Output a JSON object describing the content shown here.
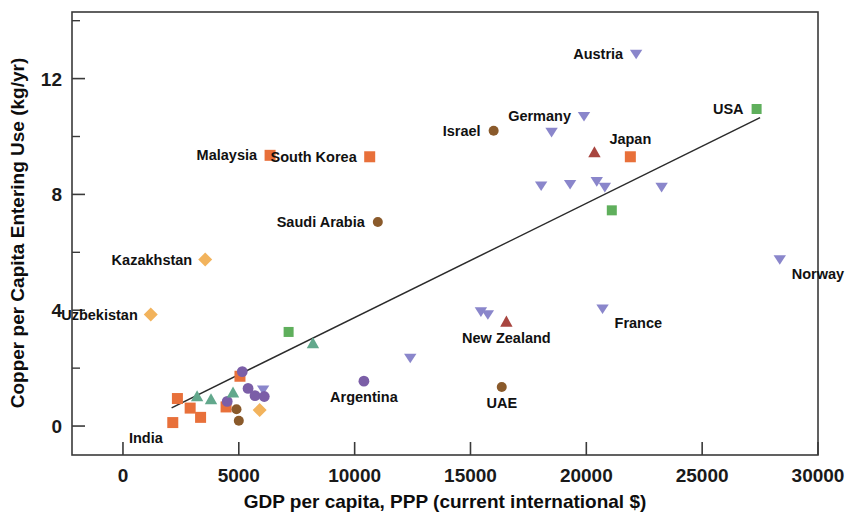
{
  "chart_data": {
    "type": "scatter",
    "title": "",
    "xlabel": "GDP per capita, PPP (current international $)",
    "ylabel": "Copper per Capita Entering Use (kg/yr)",
    "xlim": [
      -2200,
      30000
    ],
    "ylim": [
      -1.0,
      14.3
    ],
    "xticks": [
      0,
      5000,
      10000,
      15000,
      20000,
      25000,
      30000
    ],
    "xtick_labels": [
      "0",
      "5000",
      "10000",
      "15000",
      "20000",
      "25000",
      "30000"
    ],
    "yticks": [
      0,
      4,
      8,
      12
    ],
    "ytick_labels": [
      "0",
      "4",
      "8",
      "12"
    ],
    "yminor_ticks": [
      2,
      6,
      10,
      14
    ],
    "grid": false,
    "legend": "none",
    "marker_colors": {
      "orange_square": "#E8703A",
      "green_square": "#5FAF5C",
      "green_triangle": "#62A88C",
      "purple_circle": "#7B5EA7",
      "purple_triangle_down": "#8A86CB",
      "red_triangle_up": "#A8453F",
      "brown_circle": "#8A5A2B",
      "gold_diamond": "#F2B35C"
    },
    "trendline": {
      "x_start": 2100,
      "y_start": 0.63,
      "x_end": 27500,
      "y_end": 10.65
    },
    "points": [
      {
        "label": "India",
        "label_pos": "below-left",
        "x": 2150,
        "y": 0.12,
        "marker": "orange_square"
      },
      {
        "label": "",
        "x": 2350,
        "y": 0.95,
        "marker": "orange_square"
      },
      {
        "label": "",
        "x": 2900,
        "y": 0.62,
        "marker": "orange_square"
      },
      {
        "label": "",
        "x": 3350,
        "y": 0.3,
        "marker": "orange_square"
      },
      {
        "label": "",
        "x": 3200,
        "y": 1.02,
        "marker": "green_triangle"
      },
      {
        "label": "",
        "x": 3800,
        "y": 0.92,
        "marker": "green_triangle"
      },
      {
        "label": "",
        "x": 4450,
        "y": 0.66,
        "marker": "orange_square"
      },
      {
        "label": "",
        "x": 4500,
        "y": 0.85,
        "marker": "purple_circle"
      },
      {
        "label": "",
        "x": 4750,
        "y": 1.15,
        "marker": "green_triangle"
      },
      {
        "label": "",
        "x": 4900,
        "y": 0.58,
        "marker": "brown_circle"
      },
      {
        "label": "",
        "x": 5000,
        "y": 0.18,
        "marker": "brown_circle"
      },
      {
        "label": "",
        "x": 5050,
        "y": 1.72,
        "marker": "orange_square"
      },
      {
        "label": "",
        "x": 5150,
        "y": 1.88,
        "marker": "purple_circle"
      },
      {
        "label": "",
        "x": 5400,
        "y": 1.3,
        "marker": "purple_circle"
      },
      {
        "label": "",
        "x": 5700,
        "y": 1.05,
        "marker": "purple_circle"
      },
      {
        "label": "",
        "x": 6050,
        "y": 1.25,
        "marker": "purple_triangle_down"
      },
      {
        "label": "",
        "x": 6100,
        "y": 1.02,
        "marker": "purple_circle"
      },
      {
        "label": "",
        "x": 5900,
        "y": 0.55,
        "marker": "gold_diamond"
      },
      {
        "label": "Kazakhstan",
        "label_pos": "left",
        "x": 3550,
        "y": 5.75,
        "marker": "gold_diamond"
      },
      {
        "label": "Uzbekistan",
        "label_pos": "left",
        "x": 1200,
        "y": 3.85,
        "marker": "gold_diamond"
      },
      {
        "label": "Malaysia",
        "label_pos": "left",
        "x": 6350,
        "y": 9.35,
        "marker": "orange_square"
      },
      {
        "label": "",
        "x": 7150,
        "y": 3.25,
        "marker": "green_square"
      },
      {
        "label": "",
        "x": 8200,
        "y": 2.85,
        "marker": "green_triangle"
      },
      {
        "label": "Argentina",
        "label_pos": "below",
        "x": 10400,
        "y": 1.55,
        "marker": "purple_circle"
      },
      {
        "label": "South Korea",
        "label_pos": "left",
        "x": 10650,
        "y": 9.3,
        "marker": "orange_square"
      },
      {
        "label": "Saudi Arabia",
        "label_pos": "left",
        "x": 11000,
        "y": 7.05,
        "marker": "brown_circle"
      },
      {
        "label": "",
        "x": 12400,
        "y": 2.35,
        "marker": "purple_triangle_down"
      },
      {
        "label": "Israel",
        "label_pos": "left",
        "x": 16000,
        "y": 10.2,
        "marker": "brown_circle"
      },
      {
        "label": "",
        "x": 15450,
        "y": 3.95,
        "marker": "purple_triangle_down"
      },
      {
        "label": "",
        "x": 15750,
        "y": 3.85,
        "marker": "purple_triangle_down"
      },
      {
        "label": "New Zealand",
        "label_pos": "below",
        "x": 16550,
        "y": 3.6,
        "marker": "red_triangle_up"
      },
      {
        "label": "UAE",
        "label_pos": "below",
        "x": 16350,
        "y": 1.35,
        "marker": "brown_circle"
      },
      {
        "label": "",
        "x": 18050,
        "y": 8.3,
        "marker": "purple_triangle_down"
      },
      {
        "label": "",
        "x": 18500,
        "y": 10.15,
        "marker": "purple_triangle_down"
      },
      {
        "label": "",
        "x": 19300,
        "y": 8.35,
        "marker": "purple_triangle_down"
      },
      {
        "label": "Germany",
        "label_pos": "left",
        "x": 19900,
        "y": 10.7,
        "marker": "purple_triangle_down"
      },
      {
        "label": "",
        "x": 20350,
        "y": 9.45,
        "marker": "red_triangle_up"
      },
      {
        "label": "",
        "x": 20450,
        "y": 8.45,
        "marker": "purple_triangle_down"
      },
      {
        "label": "",
        "x": 20800,
        "y": 8.25,
        "marker": "purple_triangle_down"
      },
      {
        "label": "France",
        "label_pos": "below-right",
        "x": 20700,
        "y": 4.05,
        "marker": "purple_triangle_down"
      },
      {
        "label": "",
        "x": 21100,
        "y": 7.45,
        "marker": "green_square"
      },
      {
        "label": "Japan",
        "label_pos": "above",
        "x": 21900,
        "y": 9.3,
        "marker": "orange_square"
      },
      {
        "label": "Austria",
        "label_pos": "left",
        "x": 22150,
        "y": 12.85,
        "marker": "purple_triangle_down"
      },
      {
        "label": "",
        "x": 23250,
        "y": 8.25,
        "marker": "purple_triangle_down"
      },
      {
        "label": "USA",
        "label_pos": "left",
        "x": 27350,
        "y": 10.95,
        "marker": "green_square"
      },
      {
        "label": "Norway",
        "label_pos": "below-right",
        "x": 28350,
        "y": 5.75,
        "marker": "purple_triangle_down"
      }
    ]
  }
}
